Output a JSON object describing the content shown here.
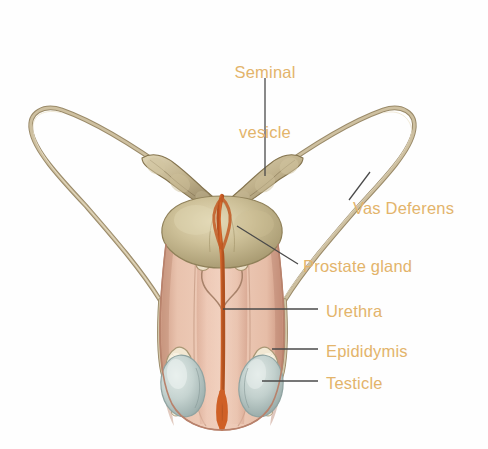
{
  "figure": {
    "background_color": "#fefefe",
    "label_color": "#e3b46b",
    "leader_line_color": "#4a4a4a",
    "palette": {
      "vas_deferens": "#c4b391",
      "vas_deferens_shadow": "#9b8a6c",
      "seminal_vesicle": "#c0ae88",
      "prostate": "#c9bd94",
      "prostate_shadow": "#a89a70",
      "urethra": "#d4622a",
      "scrotum": "#e8bda8",
      "scrotum_shadow": "#c99680",
      "testicle": "#c3d2d0",
      "testicle_shadow": "#9fb2b0",
      "epididymis": "#efe4cf"
    }
  },
  "labels": [
    {
      "id": "seminal-vesicle",
      "text_line1": "Seminal",
      "text_line2": "vesicle",
      "x": 206,
      "y": 22,
      "width": 118
    },
    {
      "id": "vas-deferens",
      "text": "Vas Deferens",
      "x": 353,
      "y": 198
    },
    {
      "id": "prostate-gland",
      "text": "Prostate gland",
      "x": 303,
      "y": 256
    },
    {
      "id": "urethra",
      "text": "Urethra",
      "x": 326,
      "y": 301
    },
    {
      "id": "epididymis",
      "text": "Epididymis",
      "x": 326,
      "y": 341
    },
    {
      "id": "testicle",
      "text": "Testicle",
      "x": 326,
      "y": 373
    }
  ],
  "anatomy_parts": [
    "vas-deferens-left",
    "vas-deferens-right",
    "seminal-vesicle-left",
    "seminal-vesicle-right",
    "prostate-gland",
    "urethra",
    "scrotum",
    "testicle-left",
    "testicle-right",
    "epididymis-left",
    "epididymis-right",
    "ejaculatory-duct-left",
    "ejaculatory-duct-right"
  ]
}
